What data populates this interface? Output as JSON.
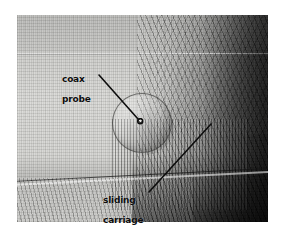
{
  "figure": {
    "kind": "halftone-photograph",
    "background_color": "#ffffff",
    "photo": {
      "border_color": "#1a1a18",
      "light_tone": "#d5d5d2",
      "dark_tone": "#141412"
    }
  },
  "annotations": [
    {
      "name": "coax-probe",
      "line1": "coax",
      "line2": "probe",
      "text_color": "#0d0d0d",
      "leader": {
        "x1": 99,
        "y1": 75,
        "x2": 138,
        "y2": 119
      },
      "marker": {
        "cx": 140,
        "cy": 121,
        "r": 2.5
      }
    },
    {
      "name": "sliding-carriage",
      "line1": "sliding",
      "line2": "carriage",
      "text_color": "#0d0d0d",
      "leader": {
        "x1": 149,
        "y1": 192,
        "x2": 211,
        "y2": 124
      }
    }
  ]
}
